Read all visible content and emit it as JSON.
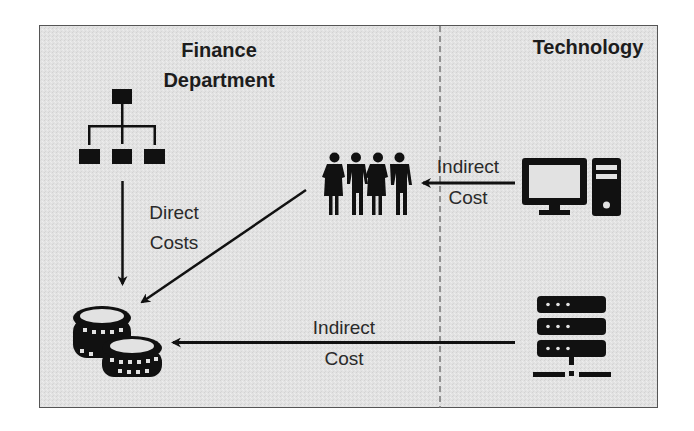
{
  "diagram": {
    "regions": {
      "finance": {
        "title_line1": "Finance",
        "title_line2": "Department"
      },
      "technology": {
        "title": "Technology"
      }
    },
    "nodes": [
      {
        "id": "org-chart",
        "icon": "org-chart-icon",
        "region": "finance"
      },
      {
        "id": "people",
        "icon": "people-group-icon",
        "region": "finance"
      },
      {
        "id": "coins",
        "icon": "coins-stack-icon",
        "region": "finance"
      },
      {
        "id": "computer",
        "icon": "desktop-computer-icon",
        "region": "technology"
      },
      {
        "id": "server",
        "icon": "server-network-icon",
        "region": "technology"
      }
    ],
    "edges": [
      {
        "from": "org-chart",
        "to": "coins",
        "label_line1": "Direct",
        "label_line2": "Costs"
      },
      {
        "from": "people",
        "to": "coins",
        "label_line1": "",
        "label_line2": ""
      },
      {
        "from": "computer",
        "to": "people",
        "label_line1": "Indirect",
        "label_line2": "Cost"
      },
      {
        "from": "server",
        "to": "coins",
        "label_line1": "Indirect",
        "label_line2": "Cost"
      }
    ],
    "colors": {
      "background": "#e2e2e2",
      "ink": "#111111",
      "border": "#555555",
      "divider": "#777777"
    }
  }
}
